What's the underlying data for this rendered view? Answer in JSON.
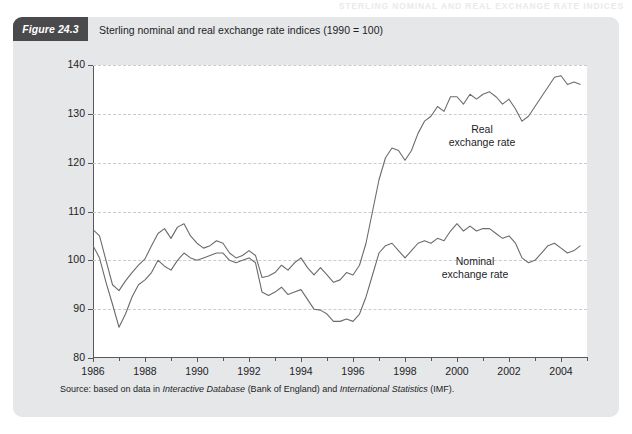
{
  "page": {
    "running_header": "STERLING NOMINAL AND REAL EXCHANGE RATE INDICES"
  },
  "figure": {
    "badge": "Figure 24.3",
    "title": "Sterling nominal and real exchange rate indices (1990 = 100)",
    "source_prefix": "Source: based on data in ",
    "source_italic_1": "Interactive Database",
    "source_mid": " (Bank of England) and ",
    "source_italic_2": "International Statistics",
    "source_suffix": " (IMF)."
  },
  "annotations": {
    "real_line1": "Real",
    "real_line2": "exchange rate",
    "nominal_line1": "Nominal",
    "nominal_line2": "exchange rate"
  },
  "chart_data": {
    "type": "line",
    "title": "Sterling nominal and real exchange rate indices (1990 = 100)",
    "xlabel": "",
    "ylabel": "",
    "xlim": [
      1986,
      2005
    ],
    "ylim": [
      80,
      140
    ],
    "ytick_values": [
      80,
      90,
      100,
      110,
      120,
      130,
      140
    ],
    "ytick_labels": [
      "80",
      "90",
      "100",
      "110",
      "120",
      "130",
      "140"
    ],
    "xtick_values": [
      1986,
      1988,
      1990,
      1992,
      1994,
      1996,
      1998,
      2000,
      2002,
      2004
    ],
    "xtick_labels": [
      "1986",
      "1988",
      "1990",
      "1992",
      "1994",
      "1996",
      "1998",
      "2000",
      "2002",
      "2004"
    ],
    "xtick_minor_step": 1,
    "grid": "horizontal-dashed",
    "legend": "annotated-inline",
    "line_color": "#6b6b6d",
    "x": [
      1986.0,
      1986.25,
      1986.5,
      1986.75,
      1987.0,
      1987.25,
      1987.5,
      1987.75,
      1988.0,
      1988.25,
      1988.5,
      1988.75,
      1989.0,
      1989.25,
      1989.5,
      1989.75,
      1990.0,
      1990.25,
      1990.5,
      1990.75,
      1991.0,
      1991.25,
      1991.5,
      1991.75,
      1992.0,
      1992.25,
      1992.5,
      1992.75,
      1993.0,
      1993.25,
      1993.5,
      1993.75,
      1994.0,
      1994.25,
      1994.5,
      1994.75,
      1995.0,
      1995.25,
      1995.5,
      1995.75,
      1996.0,
      1996.25,
      1996.5,
      1996.75,
      1997.0,
      1997.25,
      1997.5,
      1997.75,
      1998.0,
      1998.25,
      1998.5,
      1998.75,
      1999.0,
      1999.25,
      1999.5,
      1999.75,
      2000.0,
      2000.25,
      2000.5,
      2000.75,
      2001.0,
      2001.25,
      2001.5,
      2001.75,
      2002.0,
      2002.25,
      2002.5,
      2002.75,
      2003.0,
      2003.25,
      2003.5,
      2003.75,
      2004.0,
      2004.25,
      2004.5,
      2004.75
    ],
    "series": [
      {
        "name": "Real exchange rate",
        "label_line1": "Real",
        "label_line2": "exchange rate",
        "values": [
          106.3,
          105.0,
          100.0,
          95.0,
          93.8,
          95.8,
          97.5,
          99.0,
          100.3,
          103.0,
          105.5,
          106.5,
          104.5,
          106.8,
          107.5,
          105.0,
          103.5,
          102.5,
          103.0,
          104.0,
          103.5,
          101.5,
          100.5,
          101.0,
          102.0,
          101.0,
          96.5,
          96.8,
          97.5,
          99.0,
          98.0,
          99.5,
          100.5,
          98.5,
          97.0,
          98.5,
          97.0,
          95.5,
          96.0,
          97.5,
          97.0,
          99.0,
          103.5,
          110.0,
          116.5,
          121.0,
          123.0,
          122.5,
          120.5,
          122.5,
          126.0,
          128.5,
          129.5,
          131.5,
          130.5,
          133.5,
          133.5,
          132.0,
          134.0,
          133.0,
          134.0,
          134.5,
          133.5,
          132.0,
          133.0,
          131.0,
          128.5,
          129.5,
          131.5,
          133.5,
          135.5,
          137.5,
          137.8,
          136.0,
          136.5,
          136.0
        ]
      },
      {
        "name": "Nominal exchange rate",
        "label_line1": "Nominal",
        "label_line2": "exchange rate",
        "values": [
          103.0,
          100.5,
          95.5,
          91.0,
          86.3,
          89.0,
          92.5,
          95.0,
          96.0,
          97.5,
          100.0,
          98.8,
          98.0,
          100.0,
          101.5,
          100.5,
          100.0,
          100.5,
          101.0,
          101.5,
          101.5,
          100.0,
          99.5,
          100.0,
          100.5,
          99.5,
          93.5,
          92.8,
          93.5,
          94.5,
          93.0,
          93.5,
          94.0,
          92.0,
          90.0,
          89.8,
          89.0,
          87.5,
          87.5,
          88.0,
          87.5,
          89.0,
          92.5,
          97.0,
          101.5,
          103.0,
          103.5,
          102.0,
          100.5,
          102.0,
          103.5,
          104.0,
          103.5,
          104.5,
          104.0,
          106.0,
          107.5,
          106.0,
          107.0,
          106.0,
          106.5,
          106.5,
          105.5,
          104.5,
          105.0,
          103.5,
          100.5,
          99.5,
          100.0,
          101.5,
          103.0,
          103.5,
          102.5,
          101.5,
          102.0,
          103.0
        ]
      }
    ]
  }
}
